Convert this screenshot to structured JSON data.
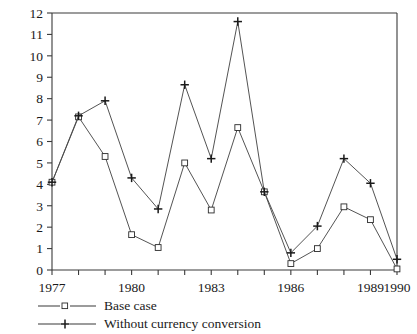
{
  "chart_data": {
    "type": "line",
    "title": "",
    "xlabel": "",
    "ylabel": "",
    "xlim": [
      1977,
      1990
    ],
    "ylim": [
      0,
      12
    ],
    "grid": false,
    "legend_position": "below-left",
    "x": [
      1977,
      1978,
      1979,
      1980,
      1981,
      1982,
      1983,
      1984,
      1985,
      1986,
      1987,
      1988,
      1989,
      1990
    ],
    "xtick_labels": [
      "1977",
      "1980",
      "1983",
      "1986",
      "1989",
      "1990"
    ],
    "xtick_values": [
      1977,
      1980,
      1983,
      1986,
      1989,
      1990
    ],
    "ytick_labels": [
      "0",
      "1",
      "2",
      "3",
      "4",
      "5",
      "6",
      "7",
      "8",
      "9",
      "10",
      "11",
      "12"
    ],
    "ytick_values": [
      0,
      1,
      2,
      3,
      4,
      5,
      6,
      7,
      8,
      9,
      10,
      11,
      12
    ],
    "series": [
      {
        "name": "Base case",
        "marker": "square",
        "values": [
          4.1,
          7.15,
          5.3,
          1.65,
          1.05,
          5.0,
          2.8,
          6.65,
          3.65,
          0.3,
          1.0,
          2.95,
          2.35,
          0.05
        ]
      },
      {
        "name": "Without currency conversion",
        "marker": "plus",
        "values": [
          4.1,
          7.2,
          7.9,
          4.3,
          2.85,
          8.65,
          5.2,
          11.6,
          3.65,
          0.8,
          2.05,
          5.2,
          4.05,
          0.5
        ]
      }
    ]
  },
  "legend": {
    "items": [
      {
        "label": "Base case",
        "marker": "square"
      },
      {
        "label": "Without currency conversion",
        "marker": "plus"
      }
    ]
  },
  "colors": {
    "axis": "#3a3a3a",
    "line": "#4a4a4a",
    "marker": "#1a1a1a",
    "background": "#ffffff"
  }
}
